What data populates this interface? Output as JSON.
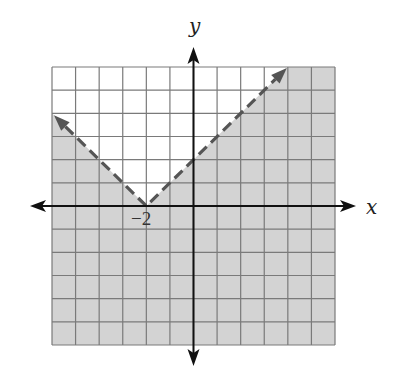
{
  "chart_data": {
    "type": "inequality-graph",
    "title": "",
    "xlabel": "x",
    "ylabel": "y",
    "xlim": [
      -6,
      6
    ],
    "ylim": [
      -6,
      6
    ],
    "grid": true,
    "grid_step": 1,
    "boundary": {
      "equation": "y = |x + 2|",
      "style": "dashed",
      "vertex": [
        -2,
        0
      ],
      "left_ray_end": [
        -6,
        4
      ],
      "right_ray_end": [
        4,
        6
      ],
      "arrows": true
    },
    "inequality": "y < |x + 2|",
    "shaded_region": "below boundary",
    "annotations": [
      {
        "text": "−2",
        "x": -2,
        "y": 0
      }
    ]
  },
  "labels": {
    "x_axis": "x",
    "y_axis": "y",
    "vertex_tick": "−2"
  },
  "colors": {
    "shade": "#d3d3d3",
    "grid": "#7a7a7a",
    "axis": "#111111",
    "boundary": "#555555"
  }
}
